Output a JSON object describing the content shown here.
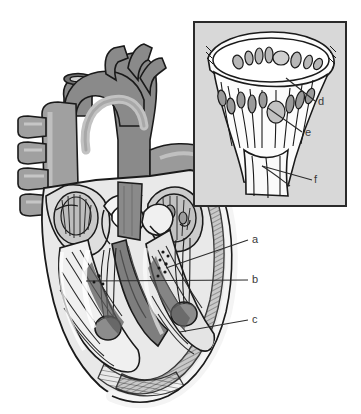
{
  "figure": {
    "type": "anatomical-illustration",
    "background_color": "#ffffff"
  },
  "labels": {
    "main": [
      {
        "key": "a",
        "text": "a",
        "x": 252,
        "y": 234,
        "leader": "diagonal-down-left"
      },
      {
        "key": "b",
        "text": "b",
        "x": 252,
        "y": 274,
        "leader": "horizontal-left"
      },
      {
        "key": "c",
        "text": "c",
        "x": 252,
        "y": 314,
        "leader": "diagonal-down-left"
      }
    ],
    "inset": [
      {
        "key": "d",
        "text": "d",
        "x": 318,
        "y": 96,
        "leader": "diagonal-up-left"
      },
      {
        "key": "e",
        "text": "e",
        "x": 305,
        "y": 127,
        "leader": "diagonal-up-left"
      },
      {
        "key": "f",
        "text": "f",
        "x": 314,
        "y": 174,
        "leader": "diagonal-up-left"
      }
    ],
    "font_size_px": 11,
    "color": "#3a3a3a"
  },
  "inset_panel": {
    "x": 194,
    "y": 22,
    "width": 152,
    "height": 184,
    "background_color": "#d8d8d8",
    "border_color": "#2b2b2b",
    "border_width": 2,
    "content": "magnified valve with cusps, chordae tendineae and papillary muscle"
  },
  "palette": {
    "outline": "#1a1a1a",
    "white": "#ffffff",
    "pale_gray": "#e6e6e6",
    "light_gray": "#cfcfcf",
    "mid_gray": "#a8a8a8",
    "dark_gray": "#8a8a8a",
    "deep_gray": "#6f6f6f",
    "shadow_gray": "#585858",
    "inset_fill": "#d8d8d8"
  },
  "structures": {
    "great_vessels": [
      "aortic arch",
      "brachiocephalic branch",
      "left common carotid branch",
      "left subclavian branch",
      "superior vena cava",
      "pulmonary veins",
      "pulmonary artery"
    ],
    "chambers": [
      "right atrium",
      "left atrium",
      "right ventricle",
      "left ventricle"
    ],
    "valve_apparatus": [
      "valve cusps",
      "chordae tendineae",
      "papillary muscles",
      "trabeculae carneae",
      "interventricular septum"
    ]
  }
}
